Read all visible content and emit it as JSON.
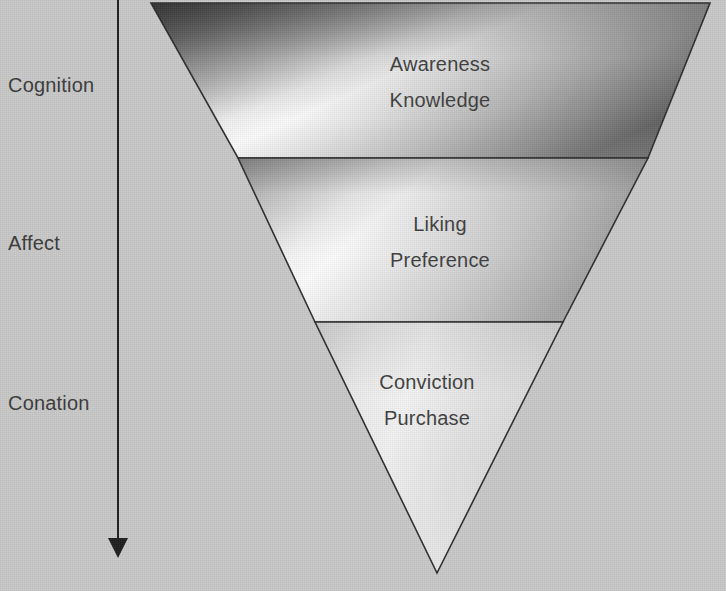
{
  "figure": {
    "type": "inverted-funnel-diagram",
    "background_color": "#c9c9c9",
    "outline_color": "#303030",
    "text_color": "#3c3c3c",
    "width": 726,
    "height": 591
  },
  "axis": {
    "arrow_name": "downward-progression-arrow",
    "direction": "top-to-bottom",
    "stages": [
      {
        "key": "cognition",
        "label": "Cognition"
      },
      {
        "key": "affect",
        "label": "Affect"
      },
      {
        "key": "conation",
        "label": "Conation"
      }
    ]
  },
  "funnel": {
    "tiers": [
      {
        "key": "cognition",
        "stage_label": "Cognition",
        "lines": [
          "Awareness",
          "Knowledge"
        ],
        "shade": "dark-corners-with-bright-diagonal-band"
      },
      {
        "key": "affect",
        "stage_label": "Affect",
        "lines": [
          "Liking",
          "Preference"
        ],
        "shade": "light-with-bright-diagonal-band"
      },
      {
        "key": "conation",
        "stage_label": "Conation",
        "lines": [
          "Conviction",
          "Purchase"
        ],
        "shade": "light-uniform"
      }
    ]
  }
}
